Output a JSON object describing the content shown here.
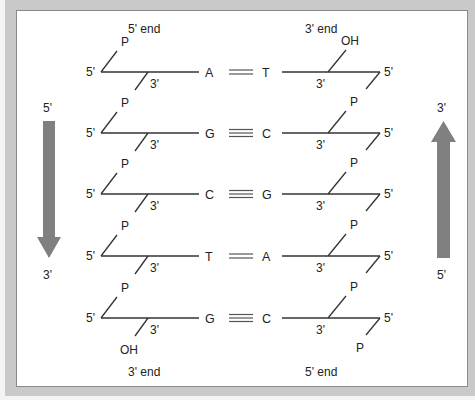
{
  "left_strand": {
    "top_label": "5' end",
    "bottom_label": "3' end",
    "arrow": {
      "start_label": "5'",
      "end_label": "3'",
      "direction": "down",
      "color": "#808080"
    }
  },
  "right_strand": {
    "top_label": "3' end",
    "bottom_label": "5' end",
    "arrow": {
      "start_label": "5'",
      "end_label": "3'",
      "direction": "up",
      "color": "#808080"
    }
  },
  "labels": {
    "five_prime": "5'",
    "three_prime": "3'",
    "phosphate": "P",
    "hydroxyl": "OH"
  },
  "base_pairs": [
    {
      "left": "A",
      "right": "T",
      "hydrogen_bonds": 2,
      "left_top_group": "P",
      "left_bottom_group": "",
      "right_top_group": "OH",
      "right_bottom_group": ""
    },
    {
      "left": "G",
      "right": "C",
      "hydrogen_bonds": 3,
      "left_top_group": "P",
      "left_bottom_group": "",
      "right_top_group": "P",
      "right_bottom_group": ""
    },
    {
      "left": "C",
      "right": "G",
      "hydrogen_bonds": 3,
      "left_top_group": "P",
      "left_bottom_group": "",
      "right_top_group": "P",
      "right_bottom_group": ""
    },
    {
      "left": "T",
      "right": "A",
      "hydrogen_bonds": 2,
      "left_top_group": "P",
      "left_bottom_group": "",
      "right_top_group": "P",
      "right_bottom_group": ""
    },
    {
      "left": "G",
      "right": "C",
      "hydrogen_bonds": 3,
      "left_top_group": "P",
      "left_bottom_group": "OH",
      "right_top_group": "P",
      "right_bottom_group": "P"
    }
  ]
}
